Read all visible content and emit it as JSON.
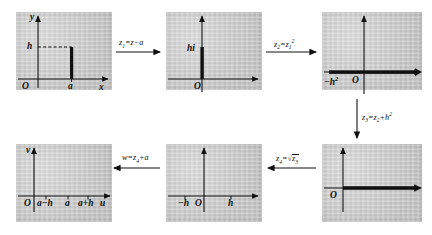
{
  "figure": {
    "background_color": "#cccccc",
    "ink_color": "#111111"
  },
  "panels": [
    {
      "id": "panel-1",
      "position": "top-left",
      "axis_x_label": "x",
      "axis_y_label": "y",
      "origin_label": "O",
      "x_tick_label": "a",
      "y_tick_label": "h",
      "feature": "vertical slit at x=a from 0 to h, dashed guide to h on y-axis"
    },
    {
      "id": "panel-2",
      "position": "top-middle",
      "axis_x_label": "",
      "axis_y_label": "",
      "origin_label": "O",
      "segment_label": "hi",
      "feature": "vertical slit on imaginary axis from 0 to hi"
    },
    {
      "id": "panel-3",
      "position": "top-right",
      "origin_label": "O",
      "left_tick_label": "−h²",
      "feature": "horizontal ray along real axis with cut from −h² rightwards"
    },
    {
      "id": "panel-4",
      "position": "bottom-right",
      "origin_label": "O",
      "feature": "horizontal ray along positive real axis from O"
    },
    {
      "id": "panel-5",
      "position": "bottom-middle",
      "origin_label": "O",
      "left_tick_label": "−h",
      "right_tick_label": "h",
      "feature": "upper half plane"
    },
    {
      "id": "panel-6",
      "position": "bottom-left",
      "axis_x_label": "u",
      "axis_y_label": "v",
      "origin_label": "O",
      "ticks": [
        "a−h",
        "a",
        "a+h"
      ],
      "feature": "upper half plane in w = u + iv"
    }
  ],
  "arrows": [
    {
      "id": "arrow-1",
      "direction": "right",
      "label_main": "z",
      "label_sub": "1",
      "label_rest": "=z−a"
    },
    {
      "id": "arrow-2",
      "direction": "right",
      "label_main": "z",
      "label_sub": "2",
      "label_rest": "=z",
      "label_tail_sub": "1",
      "label_tail_sup": "2"
    },
    {
      "id": "arrow-3",
      "direction": "down",
      "label_main": "z",
      "label_sub": "3",
      "label_rest": "=z",
      "label_tail_sub": "2",
      "label_tail_rest": "+h",
      "label_tail_sup": "2"
    },
    {
      "id": "arrow-4",
      "direction": "left",
      "label_main": "z",
      "label_sub": "4",
      "label_rest": "=√z",
      "label_tail_sub": "3"
    },
    {
      "id": "arrow-5",
      "direction": "left",
      "label_main": "w",
      "label_sub": "",
      "label_rest": "=z",
      "label_tail_sub": "4",
      "label_tail_rest": "+a"
    }
  ],
  "arrow_labels": {
    "a1_z": "z",
    "a1_sub": "1",
    "a1_rest": "=z−a",
    "a2_z": "z",
    "a2_sub": "2",
    "a2_eq": "=z",
    "a2_sub2": "1",
    "a2_sup": "2",
    "a3_z": "z",
    "a3_sub": "3",
    "a3_eq": "=z",
    "a3_sub2": "2",
    "a3_plus": "+h",
    "a3_sup": "2",
    "a4_z": "z",
    "a4_sub": "4",
    "a4_eq": "=",
    "a4_radical": "√",
    "a4_inner": "z",
    "a4_inner_sub": "3",
    "a5_w": "w",
    "a5_eq": "=z",
    "a5_sub": "4",
    "a5_plus": "+a"
  },
  "panel_labels": {
    "p1_y": "y",
    "p1_x": "x",
    "p1_O": "O",
    "p1_a": "a",
    "p1_h": "h",
    "p2_O": "O",
    "p2_hi": "hi",
    "p3_O": "O",
    "p3_mh2_minus": "−h",
    "p3_mh2_sup": "2",
    "p4_O": "O",
    "p5_O": "O",
    "p5_mh": "−h",
    "p5_h": "h",
    "p6_v": "v",
    "p6_u": "u",
    "p6_O": "O",
    "p6_amh": "a−h",
    "p6_a": "a",
    "p6_aph": "a+h"
  }
}
